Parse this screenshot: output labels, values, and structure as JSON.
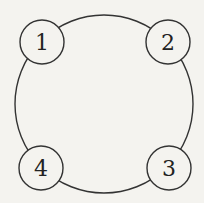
{
  "diagram": {
    "type": "ring",
    "big_circle": {
      "cx": 104,
      "cy": 104,
      "r": 89
    },
    "stroke_color": "#333333",
    "background": "#f4f3ef",
    "nodes": [
      {
        "id": "1",
        "label": "1",
        "cx": 42,
        "cy": 42,
        "r": 22
      },
      {
        "id": "2",
        "label": "2",
        "cx": 168,
        "cy": 42,
        "r": 22
      },
      {
        "id": "3",
        "label": "3",
        "cx": 169,
        "cy": 168,
        "r": 22
      },
      {
        "id": "4",
        "label": "4",
        "cx": 41,
        "cy": 168,
        "r": 22
      }
    ],
    "edges": [
      [
        "1",
        "2"
      ],
      [
        "2",
        "3"
      ],
      [
        "3",
        "4"
      ],
      [
        "4",
        "1"
      ]
    ]
  }
}
